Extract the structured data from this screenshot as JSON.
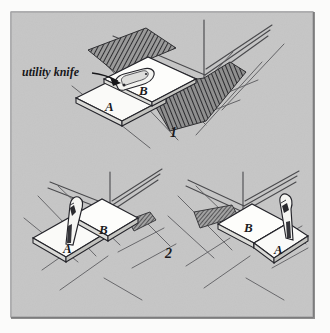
{
  "figure": {
    "caption_label": "utility knife",
    "background_color": "#c6c6c6",
    "page_color": "#fbfbfa",
    "ink_color": "#1b1b1e",
    "tile_color": "#fafaf8",
    "hatch_color": "#3a3a3d"
  },
  "steps": [
    {
      "number": "1",
      "number_x": 172,
      "number_y": 133,
      "description": "Tile B is laid over tile A and pushed against the wall; the utility knife lies flat on tile B to mark the cut line.",
      "tiles": [
        {
          "letter": "A",
          "x": 109,
          "y": 108
        },
        {
          "letter": "B",
          "x": 141,
          "y": 92
        }
      ],
      "tools": [
        {
          "name": "utility-knife",
          "orientation": "flat"
        }
      ]
    },
    {
      "number": "2",
      "number_x": 168,
      "number_y": 254,
      "description": "The utility knife is held upright against the edge of the overlapping tile and drawn through to cut tile A.",
      "tiles": [
        {
          "letter": "A",
          "x": 68,
          "y": 250
        },
        {
          "letter": "B",
          "x": 103,
          "y": 231
        }
      ],
      "tools": [
        {
          "name": "utility-knife",
          "orientation": "upright"
        }
      ]
    },
    {
      "number": "2b",
      "description": "Mirrored view of the same cut with tile B on the left and tile A beneath the knife on the right.",
      "tiles": [
        {
          "letter": "B",
          "x": 248,
          "y": 228
        },
        {
          "letter": "A",
          "x": 278,
          "y": 250
        }
      ],
      "tools": [
        {
          "name": "utility-knife",
          "orientation": "upright"
        }
      ]
    }
  ],
  "annotations": [
    {
      "name": "utility-knife-callout",
      "text": "utility knife",
      "text_x": 22,
      "text_y": 76,
      "leader_from": {
        "x": 92,
        "y": 73
      },
      "leader_to": {
        "x": 119,
        "y": 81
      }
    }
  ]
}
